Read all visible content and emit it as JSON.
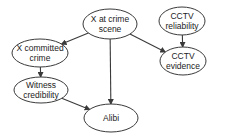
{
  "diagram": {
    "type": "directed-graph",
    "colors": {
      "stroke": "#3a3a3a",
      "fill": "#ffffff",
      "text": "#222222"
    },
    "nodes": [
      {
        "id": "scene",
        "lines": [
          "X at crime",
          "scene"
        ],
        "cx": 110,
        "cy": 24,
        "rx": 27,
        "ry": 15
      },
      {
        "id": "cctv_rel",
        "lines": [
          "CCTV",
          "reliability"
        ],
        "cx": 182,
        "cy": 21,
        "rx": 23,
        "ry": 14
      },
      {
        "id": "cctv_ev",
        "lines": [
          "CCTV",
          "evidence"
        ],
        "cx": 183,
        "cy": 61,
        "rx": 23,
        "ry": 14
      },
      {
        "id": "committed",
        "lines": [
          "X committed",
          "crime"
        ],
        "cx": 40,
        "cy": 53,
        "rx": 28,
        "ry": 14
      },
      {
        "id": "witness",
        "lines": [
          "Witness",
          "credibility"
        ],
        "cx": 41,
        "cy": 90,
        "rx": 27,
        "ry": 13
      },
      {
        "id": "alibi",
        "lines": [
          "Alibi"
        ],
        "cx": 111,
        "cy": 118,
        "rx": 27,
        "ry": 14
      }
    ],
    "edges": [
      {
        "from": "scene",
        "to": "committed"
      },
      {
        "from": "scene",
        "to": "alibi"
      },
      {
        "from": "scene",
        "to": "cctv_ev"
      },
      {
        "from": "cctv_rel",
        "to": "cctv_ev"
      },
      {
        "from": "committed",
        "to": "witness"
      },
      {
        "from": "witness",
        "to": "alibi"
      }
    ]
  }
}
